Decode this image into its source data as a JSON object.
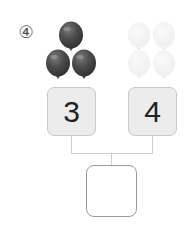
{
  "question_number": "④",
  "left": {
    "value": "3",
    "balloon_count": 3,
    "balloon_color": "#4a4a4a"
  },
  "right": {
    "value": "4",
    "balloon_count": 4,
    "balloon_color": "#f2f2f2"
  },
  "answer": {
    "value": ""
  }
}
